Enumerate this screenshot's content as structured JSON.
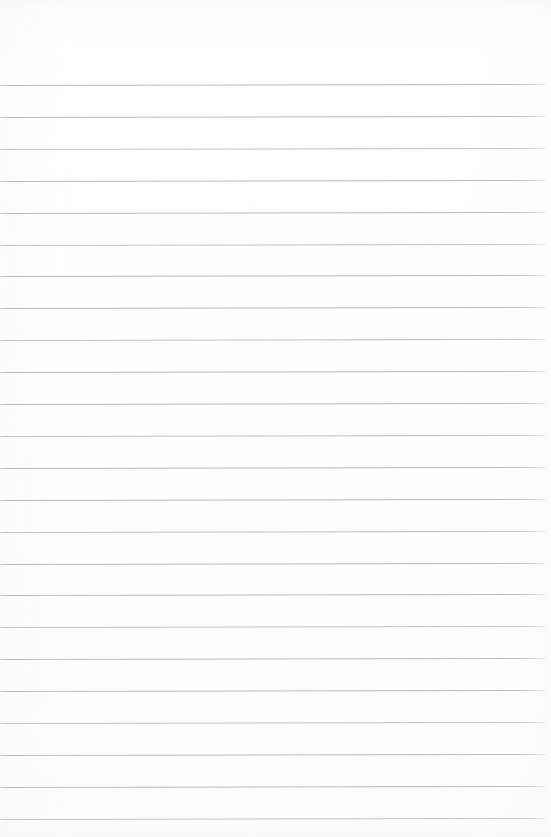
{
  "document": {
    "type": "lined-paper",
    "title": "",
    "body_text": "",
    "has_header_text": false,
    "has_written_content": false,
    "page_number": ""
  },
  "paper": {
    "width_px": 551,
    "height_px": 837,
    "background_color": "#fdfdfd",
    "rule_color": "#b9bdc1",
    "rule_thickness_px": 1,
    "rule_count": 24,
    "rule_spacing_px": 31.9,
    "first_rule_y_px": 85,
    "last_rule_y_px": 818,
    "rule_left_x_px": 0,
    "rule_right_x_px": 547,
    "top_margin_px": 85,
    "bottom_margin_px": 19,
    "has_vertical_margin_rule": false,
    "rule_tilt_deg": -0.1
  },
  "rules": [
    {
      "index": 1,
      "y": 85.0
    },
    {
      "index": 2,
      "y": 116.9
    },
    {
      "index": 3,
      "y": 148.8
    },
    {
      "index": 4,
      "y": 180.7
    },
    {
      "index": 5,
      "y": 212.6
    },
    {
      "index": 6,
      "y": 244.5
    },
    {
      "index": 7,
      "y": 276.4
    },
    {
      "index": 8,
      "y": 308.3
    },
    {
      "index": 9,
      "y": 340.2
    },
    {
      "index": 10,
      "y": 372.1
    },
    {
      "index": 11,
      "y": 404.0
    },
    {
      "index": 12,
      "y": 435.9
    },
    {
      "index": 13,
      "y": 467.8
    },
    {
      "index": 14,
      "y": 499.7
    },
    {
      "index": 15,
      "y": 531.6
    },
    {
      "index": 16,
      "y": 563.5
    },
    {
      "index": 17,
      "y": 595.4
    },
    {
      "index": 18,
      "y": 627.3
    },
    {
      "index": 19,
      "y": 659.2
    },
    {
      "index": 20,
      "y": 691.1
    },
    {
      "index": 21,
      "y": 723.0
    },
    {
      "index": 22,
      "y": 754.9
    },
    {
      "index": 23,
      "y": 786.8
    },
    {
      "index": 24,
      "y": 818.7
    }
  ]
}
